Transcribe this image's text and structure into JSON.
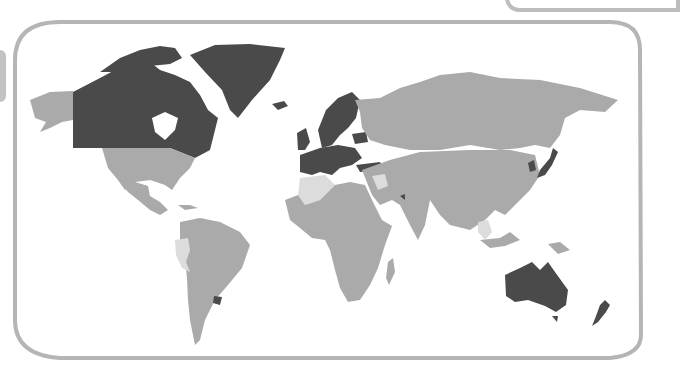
{
  "map": {
    "title": "",
    "type": "world-choropleth",
    "legend": [],
    "colors": {
      "high": "#4a4a4a",
      "medium": "#aaaaaa",
      "low": "#dcdcdc",
      "water": "#ffffff",
      "frame": "#b5b5b5"
    },
    "categories": {
      "high": [
        "Canada",
        "Greenland",
        "Norway",
        "Sweden",
        "Finland",
        "Iceland",
        "United Kingdom",
        "Ireland",
        "France",
        "Spain",
        "Portugal",
        "Germany",
        "Italy",
        "Poland",
        "Belarus",
        "Turkey",
        "Netherlands",
        "Belgium",
        "Denmark",
        "Austria",
        "Switzerland",
        "Czechia",
        "Slovakia",
        "Hungary",
        "Romania",
        "South Korea",
        "Japan",
        "United Arab Emirates",
        "Uruguay",
        "Australia",
        "New Zealand"
      ],
      "medium": [
        "United States",
        "Mexico",
        "Brazil",
        "Argentina",
        "Chile",
        "Russia",
        "China",
        "India",
        "Kazakhstan",
        "Mongolia",
        "Iran",
        "Saudi Arabia",
        "Egypt",
        "Nigeria",
        "DR Congo",
        "South Africa",
        "Madagascar",
        "Indonesia",
        "Papua New Guinea",
        "Vietnam",
        "Thailand"
      ],
      "low": [
        "Peru",
        "Ecuador",
        "Algeria",
        "Mali",
        "Iraq",
        "Myanmar",
        "Malaysia",
        "Syria"
      ]
    }
  }
}
